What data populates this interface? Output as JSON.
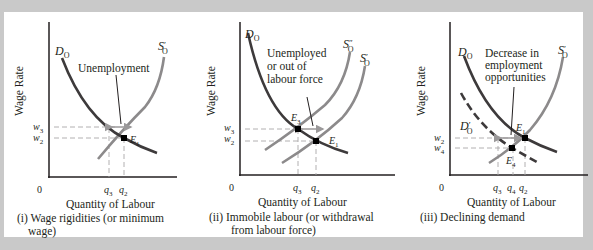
{
  "colors": {
    "background_frame": "#c9c9c9",
    "panel_bg": "#ffffff",
    "demand_curve": "#3d3a3b",
    "supply_curve": "#8c8a8b",
    "axis": "#231f20",
    "guide_dash": "#a9a7a8",
    "arrow": "#9b999a",
    "point": "#000000"
  },
  "panels": [
    {
      "id": "i",
      "y_axis_label": "Wage Rate",
      "x_axis_label": "Quantity of Labour",
      "origin": "0",
      "caption_line1": "(i) Wage rigidities (or minimum",
      "caption_line2": "wage)",
      "curves": {
        "demand": "D",
        "demand_sub": "O",
        "supply": "S",
        "supply_prime": "′",
        "supply_sub": "O"
      },
      "annotation": "Unemployment",
      "y_ticks": [
        {
          "main": "w",
          "sub": "3"
        },
        {
          "main": "w",
          "sub": "2"
        }
      ],
      "x_ticks": [
        {
          "main": "q",
          "sub": "3"
        },
        {
          "main": "q",
          "sub": "2"
        }
      ],
      "points": [
        {
          "main": "E",
          "sub": "1"
        }
      ]
    },
    {
      "id": "ii",
      "y_axis_label": "Wage Rate",
      "x_axis_label": "Quantity of Labour",
      "origin": "0",
      "caption_line1": "(ii) Immobile labour (or withdrawal",
      "caption_line2": "from labour force)",
      "curves": {
        "demand": "D",
        "demand_sub": "O",
        "supply2": "S",
        "supply2_prime": "″",
        "supply2_sub": "O",
        "supply": "S",
        "supply_prime": "′",
        "supply_sub": "O"
      },
      "annotation_line1": "Unemployed",
      "annotation_line2": "or out of",
      "annotation_line3": "labour force",
      "y_ticks": [
        {
          "main": "w",
          "sub": "3"
        },
        {
          "main": "w",
          "sub": "2"
        }
      ],
      "x_ticks": [
        {
          "main": "q",
          "sub": "3"
        },
        {
          "main": "q",
          "sub": "2"
        }
      ],
      "points": [
        {
          "main": "E",
          "sub": "3"
        },
        {
          "main": "E",
          "sub": "1"
        }
      ]
    },
    {
      "id": "iii",
      "y_axis_label": "Wage Rate",
      "x_axis_label": "Quantity of Labour",
      "origin": "0",
      "caption_line1": "(iii) Declining demand",
      "curves": {
        "demand": "D",
        "demand_sub": "O",
        "demand2": "D",
        "demand2_prime": "′",
        "demand2_sub": "O",
        "supply": "S",
        "supply_prime": "′",
        "supply_sub": "O"
      },
      "annotation_line1": "Decrease in",
      "annotation_line2": "employment",
      "annotation_line3": "opportunities",
      "y_ticks": [
        {
          "main": "w",
          "sub": "2"
        },
        {
          "main": "w",
          "sub": "4"
        }
      ],
      "x_ticks": [
        {
          "main": "q",
          "sub": "3"
        },
        {
          "main": "q",
          "sub": "4"
        },
        {
          "main": "q",
          "sub": "2"
        }
      ],
      "points": [
        {
          "main": "E",
          "sub": "1"
        },
        {
          "main": "E",
          "sub": "4"
        }
      ]
    }
  ]
}
